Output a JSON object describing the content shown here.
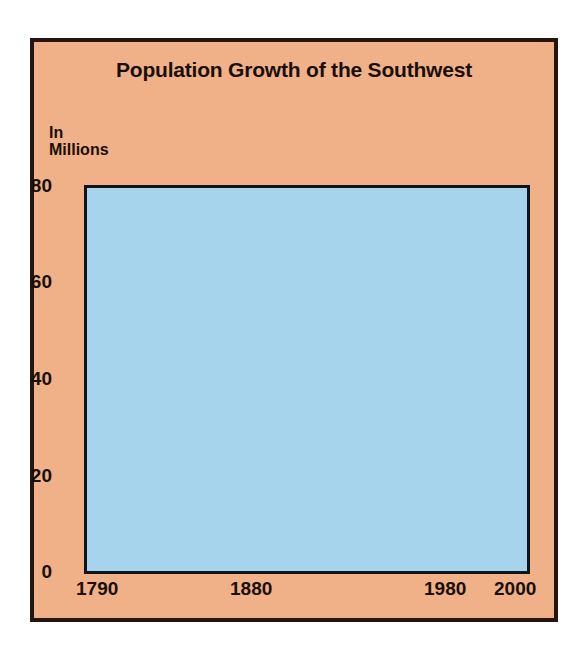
{
  "figure": {
    "title": "Population Growth of the Southwest",
    "y_axis_label": "In\nMillions",
    "background_color": "#F0B189",
    "plot_background_color": "#A5D4EC",
    "border_color": "#231510",
    "line_color": "#000000"
  },
  "chart_data": {
    "type": "line",
    "title": "Population Growth of the Southwest",
    "xlabel": "",
    "ylabel": "In Millions",
    "xlim": [
      1790,
      2010
    ],
    "ylim": [
      0,
      80
    ],
    "grid": true,
    "legend": "none",
    "x_ticks": [
      "1790",
      "1880",
      "1980",
      "2000"
    ],
    "x_tick_values": [
      1790,
      1880,
      1980,
      2000
    ],
    "y_ticks": [
      "0",
      "20",
      "40",
      "60",
      "80"
    ],
    "y_tick_values": [
      0,
      20,
      40,
      60,
      80
    ],
    "series": [
      {
        "name": "Population (historical)",
        "style": "solid",
        "x": [
          1790,
          1820,
          1850,
          1880,
          1900,
          1920,
          1940,
          1950,
          1960,
          1970,
          1980
        ],
        "values": [
          0.2,
          0.4,
          0.8,
          1.6,
          2.6,
          4.2,
          6.3,
          8.4,
          11.5,
          15.5,
          21.0
        ]
      },
      {
        "name": "Population (projected)",
        "style": "dashed",
        "x": [
          1980,
          1985,
          1990,
          1995,
          2000
        ],
        "values": [
          21.0,
          21.9,
          22.5,
          22.9,
          23.2
        ]
      }
    ]
  }
}
